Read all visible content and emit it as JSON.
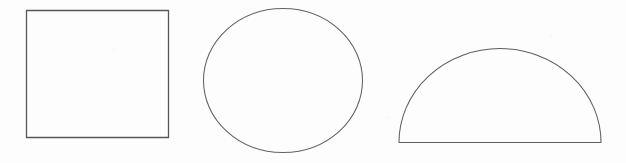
{
  "figure": {
    "background_color": "#fdfdfd",
    "stroke_color": "#5c5c5c",
    "canvas": {
      "width": 626,
      "height": 163
    },
    "shape_count": "3",
    "shapes": [
      {
        "id": "square",
        "name": "square",
        "label": "Square",
        "stroke_color": "#585858",
        "fill": "none",
        "geometry": {
          "x": 26,
          "y": 10,
          "width": 143,
          "height": 128
        }
      },
      {
        "id": "circle",
        "name": "circle",
        "label": "Circle",
        "stroke_color": "#616161",
        "fill": "none",
        "geometry": {
          "cx": 283,
          "cy": 80.5,
          "rx": 80,
          "ry": 72.5
        }
      },
      {
        "id": "dome",
        "name": "semicircle",
        "label": "Semicircle",
        "stroke_color": "#5e5e5e",
        "fill": "none",
        "geometry": {
          "cx": 500,
          "baseline_y": 142,
          "rx": 101,
          "ry": 94,
          "base_left_x": 399,
          "base_right_x": 601,
          "apex_y": 48
        }
      }
    ]
  }
}
